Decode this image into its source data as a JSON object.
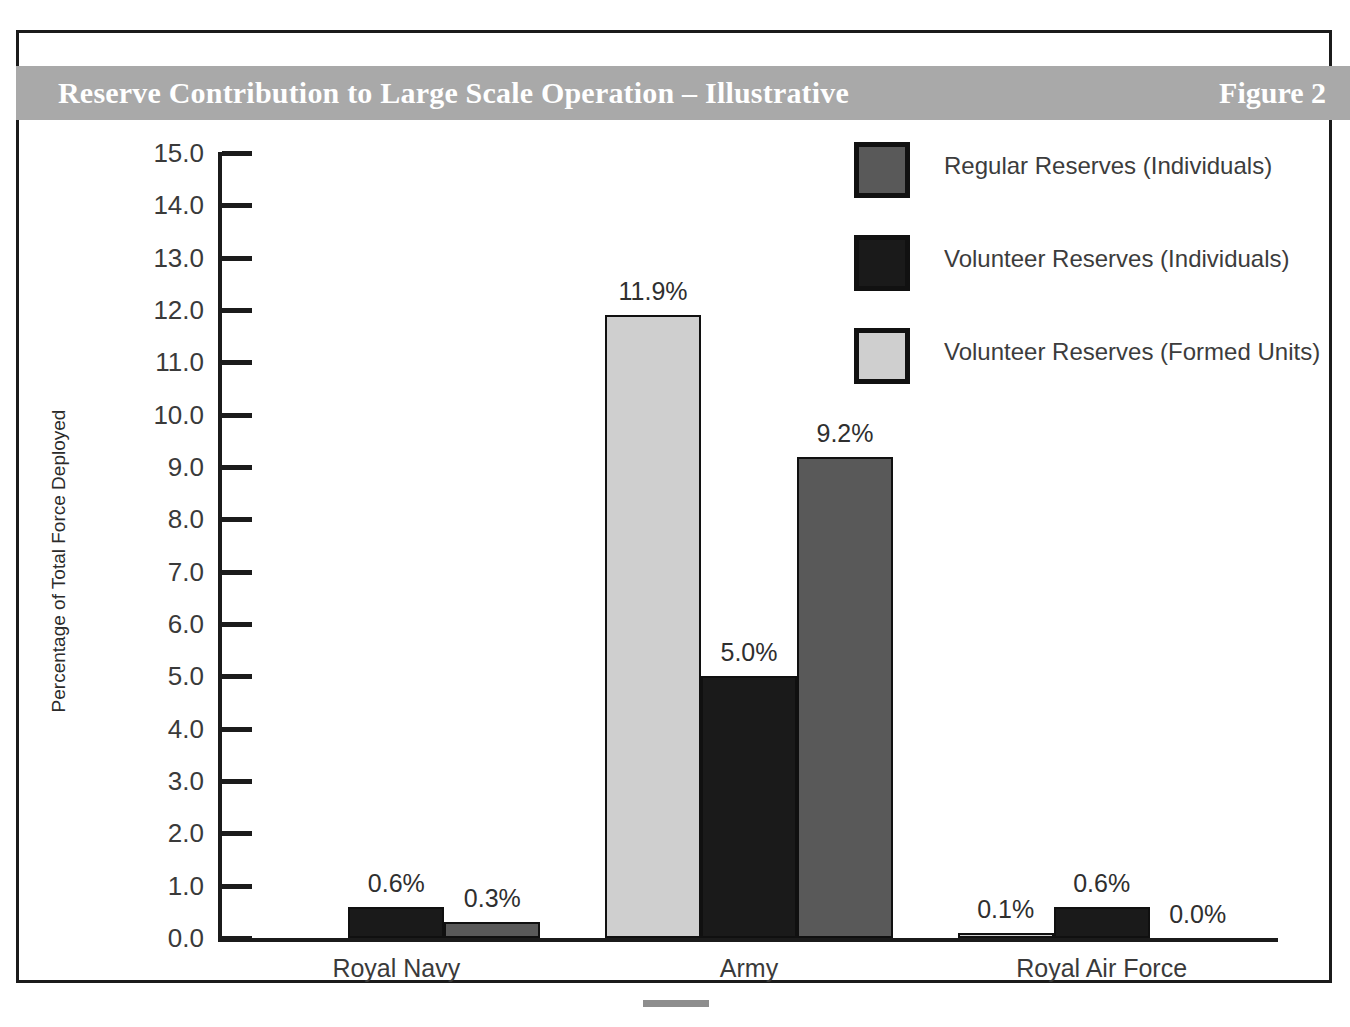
{
  "figure": {
    "title": "Reserve Contribution to Large Scale Operation – Illustrative",
    "figure_label": "Figure 2"
  },
  "legend": {
    "position": "top-right",
    "items": [
      {
        "label": "Regular Reserves (Individuals)",
        "color": "#595959"
      },
      {
        "label": "Volunteer Reserves (Individuals)",
        "color": "#1a1a1a"
      },
      {
        "label": "Volunteer Reserves (Formed Units)",
        "color": "#cfcfcf"
      }
    ]
  },
  "chart_data": {
    "type": "bar",
    "title": "Reserve Contribution to Large Scale Operation – Illustrative",
    "xlabel": "",
    "ylabel": "Percentage of Total Force Deployed",
    "ylim": [
      0,
      15
    ],
    "ytick_step": 1,
    "grid": false,
    "categories": [
      "Royal Navy",
      "Army",
      "Royal Air Force"
    ],
    "ytick_labels": [
      "0.0",
      "1.0",
      "2.0",
      "3.0",
      "4.0",
      "5.0",
      "6.0",
      "7.0",
      "8.0",
      "9.0",
      "10.0",
      "11.0",
      "12.0",
      "13.0",
      "14.0",
      "15.0"
    ],
    "series": [
      {
        "name": "Volunteer Reserves (Formed Units)",
        "color": "#cfcfcf",
        "values": [
          0.0,
          11.9,
          0.1
        ],
        "labels": [
          "",
          "11.9%",
          "0.1%"
        ]
      },
      {
        "name": "Volunteer Reserves (Individuals)",
        "color": "#1a1a1a",
        "values": [
          0.6,
          5.0,
          0.6
        ],
        "labels": [
          "0.6%",
          "5.0%",
          "0.6%"
        ]
      },
      {
        "name": "Regular Reserves (Individuals)",
        "color": "#595959",
        "values": [
          0.3,
          9.2,
          0.0
        ],
        "labels": [
          "0.3%",
          "9.2%",
          "0.0%"
        ]
      }
    ]
  },
  "axis": {
    "ticks": [
      {
        "value": "15.0"
      },
      {
        "value": "14.0"
      },
      {
        "value": "13.0"
      },
      {
        "value": "12.0"
      },
      {
        "value": "11.0"
      },
      {
        "value": "10.0"
      },
      {
        "value": "9.0"
      },
      {
        "value": "8.0"
      },
      {
        "value": "7.0"
      },
      {
        "value": "6.0"
      },
      {
        "value": "5.0"
      },
      {
        "value": "4.0"
      },
      {
        "value": "3.0"
      },
      {
        "value": "2.0"
      },
      {
        "value": "1.0"
      },
      {
        "value": "0.0"
      }
    ]
  }
}
